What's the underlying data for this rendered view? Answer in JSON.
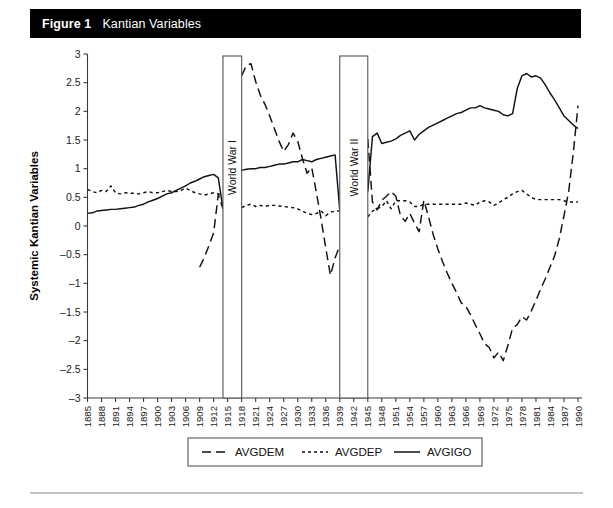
{
  "figure": {
    "number_label": "Figure 1",
    "caption": "Kantian Variables"
  },
  "axes": {
    "y_title": "Systemic Kantian Variables",
    "x_title": "Year",
    "y_ticks": [
      "3",
      "2.5",
      "2",
      "1.5",
      "1",
      "0.5",
      "0",
      "–0.5",
      "–1",
      "–1.5",
      "–2",
      "–2.5",
      "–3"
    ]
  },
  "annotations": [
    {
      "name": "world-war-1",
      "label": "World War I",
      "start": 1914,
      "end": 1918
    },
    {
      "name": "world-war-2",
      "label": "World War II",
      "start": 1939,
      "end": 1945
    }
  ],
  "legend": {
    "items": [
      {
        "label": "AVGDEM",
        "dash": "9,5"
      },
      {
        "label": "AVGDEP",
        "dash": "3,3"
      },
      {
        "label": "AVGIGO",
        "dash": "none"
      }
    ]
  },
  "chart_data": {
    "type": "line",
    "title": "Kantian Variables",
    "xlabel": "Year",
    "ylabel": "Systemic Kantian Variables",
    "xlim": [
      1885,
      1990
    ],
    "ylim": [
      -3,
      3
    ],
    "grid": false,
    "legend_position": "bottom",
    "x_tick_labels": [
      "1885",
      "1888",
      "1891",
      "1894",
      "1897",
      "1900",
      "1903",
      "1906",
      "1909",
      "1912",
      "1915",
      "1918",
      "1921",
      "1924",
      "1927",
      "1930",
      "1933",
      "1936",
      "1939",
      "1942",
      "1945",
      "1948",
      "1951",
      "1954",
      "1957",
      "1960",
      "1963",
      "1966",
      "1969",
      "1972",
      "1975",
      "1978",
      "1981",
      "1984",
      "1987",
      "1990"
    ],
    "x_tick_values": [
      1885,
      1888,
      1891,
      1894,
      1897,
      1900,
      1903,
      1906,
      1909,
      1912,
      1915,
      1918,
      1921,
      1924,
      1927,
      1930,
      1933,
      1936,
      1939,
      1942,
      1945,
      1948,
      1951,
      1954,
      1957,
      1960,
      1963,
      1966,
      1969,
      1972,
      1975,
      1978,
      1981,
      1984,
      1987,
      1990
    ],
    "series": [
      {
        "name": "AVGDEM",
        "style": "long-dash",
        "segments": [
          {
            "x": [
              1909,
              1910,
              1911,
              1912,
              1913,
              1914
            ],
            "values": [
              -0.72,
              -0.55,
              -0.34,
              -0.12,
              0.55,
              0.3
            ]
          },
          {
            "x": [
              1918,
              1919,
              1920,
              1921,
              1922,
              1923,
              1924,
              1925,
              1926,
              1927,
              1928,
              1929,
              1930,
              1931,
              1932,
              1933,
              1934,
              1935,
              1936,
              1937,
              1938,
              1939
            ],
            "values": [
              2.62,
              2.8,
              2.83,
              2.52,
              2.28,
              2.12,
              1.92,
              1.7,
              1.48,
              1.3,
              1.42,
              1.62,
              1.48,
              1.18,
              0.92,
              1.02,
              0.58,
              0.12,
              -0.38,
              -0.86,
              -0.56,
              -0.34
            ]
          },
          {
            "x": [
              1945,
              1946,
              1947,
              1948,
              1949,
              1950,
              1951,
              1952,
              1953,
              1954,
              1955,
              1956,
              1957,
              1958,
              1959,
              1960,
              1961,
              1962,
              1963,
              1964,
              1965,
              1966,
              1967,
              1968,
              1969,
              1970,
              1971,
              1972,
              1973,
              1974,
              1975,
              1976,
              1977,
              1978,
              1979,
              1980,
              1981,
              1982,
              1983,
              1984,
              1985,
              1986,
              1987,
              1988,
              1989,
              1990
            ],
            "values": [
              1.52,
              0.42,
              0.28,
              0.45,
              0.52,
              0.6,
              0.52,
              0.18,
              0.08,
              0.22,
              0.05,
              -0.1,
              0.45,
              0.16,
              -0.15,
              -0.4,
              -0.62,
              -0.82,
              -1.0,
              -1.16,
              -1.34,
              -1.4,
              -1.55,
              -1.72,
              -1.88,
              -2.05,
              -2.12,
              -2.3,
              -2.2,
              -2.35,
              -2.08,
              -1.78,
              -1.72,
              -1.58,
              -1.64,
              -1.48,
              -1.3,
              -1.1,
              -0.92,
              -0.72,
              -0.52,
              -0.22,
              0.18,
              0.6,
              1.28,
              2.1
            ]
          }
        ]
      },
      {
        "name": "AVGDEP",
        "style": "short-dash",
        "segments": [
          {
            "x": [
              1885,
              1886,
              1887,
              1888,
              1889,
              1890,
              1891,
              1892,
              1893,
              1894,
              1895,
              1896,
              1897,
              1898,
              1899,
              1900,
              1901,
              1902,
              1903,
              1904,
              1905,
              1906,
              1907,
              1908,
              1909,
              1910,
              1911,
              1912,
              1913,
              1914
            ],
            "values": [
              0.64,
              0.6,
              0.58,
              0.62,
              0.6,
              0.7,
              0.58,
              0.56,
              0.58,
              0.57,
              0.57,
              0.56,
              0.58,
              0.6,
              0.58,
              0.58,
              0.6,
              0.62,
              0.6,
              0.6,
              0.62,
              0.66,
              0.62,
              0.58,
              0.56,
              0.54,
              0.56,
              0.58,
              0.56,
              0.54
            ]
          },
          {
            "x": [
              1918,
              1919,
              1920,
              1921,
              1922,
              1923,
              1924,
              1925,
              1926,
              1927,
              1928,
              1929,
              1930,
              1931,
              1932,
              1933,
              1934,
              1935,
              1936,
              1937,
              1938,
              1939
            ],
            "values": [
              0.32,
              0.36,
              0.38,
              0.34,
              0.36,
              0.34,
              0.36,
              0.36,
              0.35,
              0.34,
              0.33,
              0.32,
              0.3,
              0.26,
              0.22,
              0.2,
              0.22,
              0.26,
              0.18,
              0.24,
              0.26,
              0.26
            ]
          },
          {
            "x": [
              1945,
              1946,
              1947,
              1948,
              1949,
              1950,
              1951,
              1952,
              1953,
              1954,
              1955,
              1956,
              1957,
              1958,
              1959,
              1960,
              1961,
              1962,
              1963,
              1964,
              1965,
              1966,
              1967,
              1968,
              1969,
              1970,
              1971,
              1972,
              1973,
              1974,
              1975,
              1976,
              1977,
              1978,
              1979,
              1980,
              1981,
              1982,
              1983,
              1984,
              1985,
              1986,
              1987,
              1988,
              1989,
              1990
            ],
            "values": [
              0.16,
              0.26,
              0.3,
              0.34,
              0.44,
              0.3,
              0.44,
              0.44,
              0.44,
              0.42,
              0.34,
              0.34,
              0.38,
              0.38,
              0.38,
              0.38,
              0.38,
              0.38,
              0.38,
              0.38,
              0.38,
              0.4,
              0.38,
              0.36,
              0.42,
              0.44,
              0.42,
              0.36,
              0.4,
              0.46,
              0.5,
              0.56,
              0.6,
              0.62,
              0.56,
              0.5,
              0.46,
              0.46,
              0.46,
              0.46,
              0.46,
              0.46,
              0.44,
              0.42,
              0.42,
              0.42
            ]
          }
        ]
      },
      {
        "name": "AVGIGO",
        "style": "solid",
        "segments": [
          {
            "x": [
              1885,
              1886,
              1887,
              1888,
              1889,
              1890,
              1891,
              1892,
              1893,
              1894,
              1895,
              1896,
              1897,
              1898,
              1899,
              1900,
              1901,
              1902,
              1903,
              1904,
              1905,
              1906,
              1907,
              1908,
              1909,
              1910,
              1911,
              1912,
              1913,
              1914
            ],
            "values": [
              0.22,
              0.23,
              0.26,
              0.27,
              0.28,
              0.29,
              0.29,
              0.3,
              0.31,
              0.32,
              0.33,
              0.36,
              0.38,
              0.42,
              0.45,
              0.48,
              0.52,
              0.56,
              0.58,
              0.62,
              0.66,
              0.7,
              0.75,
              0.78,
              0.82,
              0.86,
              0.88,
              0.9,
              0.84,
              0.3
            ]
          },
          {
            "x": [
              1918,
              1919,
              1920,
              1921,
              1922,
              1923,
              1924,
              1925,
              1926,
              1927,
              1928,
              1929,
              1930,
              1931,
              1932,
              1933,
              1934,
              1935,
              1936,
              1937,
              1938,
              1939
            ],
            "values": [
              0.97,
              0.99,
              1.0,
              1.0,
              1.02,
              1.02,
              1.04,
              1.06,
              1.08,
              1.08,
              1.1,
              1.12,
              1.12,
              1.16,
              1.14,
              1.12,
              1.16,
              1.18,
              1.2,
              1.22,
              1.24,
              0.28
            ]
          },
          {
            "x": [
              1945,
              1946,
              1947,
              1948,
              1949,
              1950,
              1951,
              1952,
              1953,
              1954,
              1955,
              1956,
              1957,
              1958,
              1959,
              1960,
              1961,
              1962,
              1963,
              1964,
              1965,
              1966,
              1967,
              1968,
              1969,
              1970,
              1971,
              1972,
              1973,
              1974,
              1975,
              1976,
              1977,
              1978,
              1979,
              1980,
              1981,
              1982,
              1983,
              1984,
              1985,
              1986,
              1987,
              1988,
              1989,
              1990
            ],
            "values": [
              0.6,
              1.56,
              1.62,
              1.44,
              1.46,
              1.48,
              1.52,
              1.58,
              1.62,
              1.66,
              1.5,
              1.6,
              1.66,
              1.72,
              1.76,
              1.8,
              1.84,
              1.88,
              1.92,
              1.96,
              1.98,
              2.02,
              2.06,
              2.06,
              2.1,
              2.06,
              2.04,
              2.02,
              2.0,
              1.94,
              1.92,
              1.96,
              2.4,
              2.62,
              2.66,
              2.6,
              2.62,
              2.58,
              2.46,
              2.32,
              2.2,
              2.06,
              1.92,
              1.84,
              1.76,
              1.7
            ]
          }
        ]
      }
    ]
  }
}
